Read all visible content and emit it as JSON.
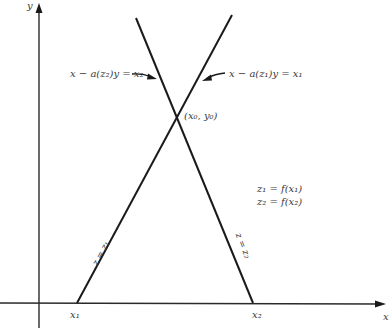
{
  "diagram": {
    "axes": {
      "y_label": "y",
      "x_label": "x"
    },
    "lines": [
      {
        "id": "line-z1",
        "label": "z = z₁",
        "equation": "x − a(z₁)y = x₁",
        "x_intercept_label": "x₁"
      },
      {
        "id": "line-z2",
        "label": "z = z₂",
        "equation": "x − a(z₂)y = x₂",
        "x_intercept_label": "x₂"
      }
    ],
    "intersection_label": "(x₀, y₀)",
    "definitions": [
      "z₁ = f(x₁)",
      "z₂ = f(x₂)"
    ],
    "colors": {
      "ink": "#1a1a1a",
      "text": "#3a3a3a",
      "background": "#ffffff"
    }
  }
}
